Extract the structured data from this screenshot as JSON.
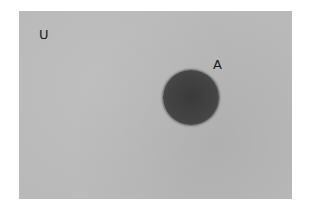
{
  "diagram": {
    "type": "venn",
    "universe": {
      "label": "U",
      "color": "#b9b9b9"
    },
    "sets": [
      {
        "label": "A",
        "shaded": true,
        "color": "#404040"
      }
    ]
  }
}
